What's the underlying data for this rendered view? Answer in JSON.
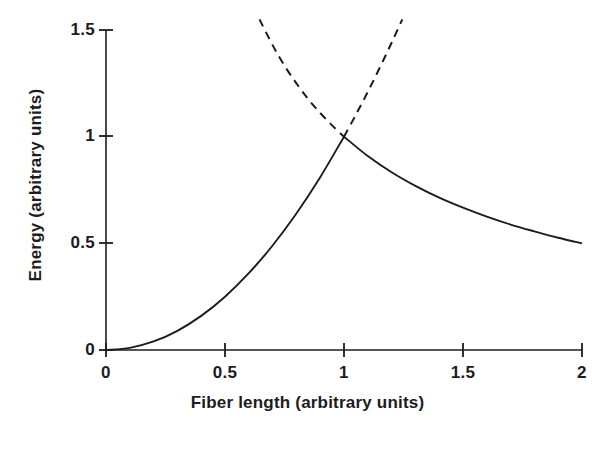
{
  "chart_data": {
    "type": "line",
    "title": "",
    "subtitle": "",
    "xlabel": "Fiber length (arbitrary units)",
    "ylabel": "Energy (arbitrary units)",
    "xlim": [
      0,
      2
    ],
    "ylim": [
      0,
      1.5
    ],
    "xticks": [
      "0",
      "0.5",
      "1",
      "1.5",
      "2"
    ],
    "xtick_values": [
      0,
      0.5,
      1,
      1.5,
      2
    ],
    "yticks": [
      "0",
      "0.5",
      "1",
      "1.5"
    ],
    "ytick_values": [
      0,
      0.5,
      1,
      1.5
    ],
    "grid": false,
    "legend": "none",
    "background_color": "#ffffff",
    "line_color": "#1c1c1c",
    "annotations": [],
    "series": [
      {
        "name": "Stretching energy (solid, rising branch)",
        "style": "solid",
        "color": "#1c1c1c",
        "x": [
          0.0,
          0.1,
          0.2,
          0.3,
          0.4,
          0.5,
          0.6,
          0.7,
          0.8,
          0.9,
          1.0
        ],
        "values": [
          0.0,
          0.01,
          0.04,
          0.09,
          0.16,
          0.25,
          0.36,
          0.49,
          0.64,
          0.81,
          1.0
        ]
      },
      {
        "name": "Compression energy (solid, falling branch)",
        "style": "solid",
        "color": "#1c1c1c",
        "x": [
          1.0,
          1.1,
          1.2,
          1.3,
          1.4,
          1.5,
          1.6,
          1.7,
          1.8,
          1.9,
          2.0
        ],
        "values": [
          1.0,
          0.909,
          0.833,
          0.769,
          0.714,
          0.667,
          0.625,
          0.588,
          0.556,
          0.526,
          0.5
        ]
      },
      {
        "name": "Rising branch continuation (dashed)",
        "style": "dashed",
        "color": "#1c1c1c",
        "x": [
          1.0,
          1.05,
          1.1,
          1.15,
          1.2,
          1.245
        ],
        "values": [
          1.0,
          1.103,
          1.21,
          1.323,
          1.44,
          1.55
        ]
      },
      {
        "name": "Falling branch continuation (dashed)",
        "style": "dashed",
        "color": "#1c1c1c",
        "x": [
          0.645,
          0.7,
          0.75,
          0.8,
          0.85,
          0.9,
          0.95,
          1.0
        ],
        "values": [
          1.55,
          1.429,
          1.333,
          1.25,
          1.176,
          1.111,
          1.053,
          1.0
        ]
      }
    ],
    "crossing_point": {
      "x": 1,
      "y": 1
    }
  },
  "axis": {
    "y_tick_labels": [
      {
        "text": "1.5"
      },
      {
        "text": "1"
      },
      {
        "text": "0.5"
      },
      {
        "text": "0"
      }
    ],
    "x_tick_labels": [
      {
        "text": "0"
      },
      {
        "text": "0.5"
      },
      {
        "text": "1"
      },
      {
        "text": "1.5"
      },
      {
        "text": "2"
      }
    ],
    "x_title": "Fiber length (arbitrary units)",
    "y_title": "Energy (arbitrary units)"
  }
}
